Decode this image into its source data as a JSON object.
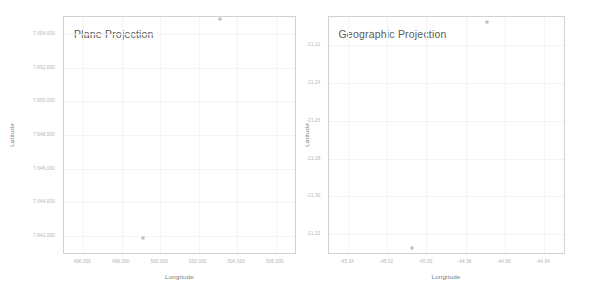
{
  "chart_data": [
    {
      "type": "scatter",
      "title": "Plane Projection",
      "xlabel": "Longitude",
      "ylabel": "Latitude",
      "grid": true,
      "legend": "none",
      "xlim": [
        495000,
        507000
      ],
      "ylim": [
        7641000,
        7655000
      ],
      "xticks": [
        "496.000",
        "498.000",
        "500.000",
        "502.000",
        "504.000",
        "506.000"
      ],
      "xtick_values": [
        496000,
        498000,
        500000,
        502000,
        504000,
        506000
      ],
      "yticks": [
        "7.654.000",
        "7.652.000",
        "7.650.000",
        "7.648.000",
        "7.646.000",
        "7.644.000",
        "7.642.000"
      ],
      "ytick_values": [
        7654000,
        7652000,
        7650000,
        7648000,
        7646000,
        7644000,
        7642000
      ],
      "points": [
        {
          "x": 503100,
          "y": 7654900
        },
        {
          "x": 499100,
          "y": 7641900
        }
      ],
      "marker_color": "#bdbdbd"
    },
    {
      "type": "scatter",
      "title": "Geographic Projection",
      "xlabel": "Longitude",
      "ylabel": "Latitude",
      "grid": true,
      "legend": "none",
      "xlim": [
        -45.05,
        -44.93
      ],
      "ylim": [
        -21.33,
        -21.205
      ],
      "xticks": [
        "-45.04",
        "-45.02",
        "-45.00",
        "-44.98",
        "-44.96",
        "-44.94"
      ],
      "xtick_values": [
        -45.04,
        -45.02,
        -45.0,
        -44.98,
        -44.96,
        -44.94
      ],
      "yticks": [
        "-21.22",
        "-21.24",
        "-21.26",
        "-21.28",
        "-21.30",
        "-21.32"
      ],
      "ytick_values": [
        -21.22,
        -21.24,
        -21.26,
        -21.28,
        -21.3,
        -21.32
      ],
      "points": [
        {
          "x": -44.969,
          "y": -21.2075
        },
        {
          "x": -45.0075,
          "y": -21.3275
        }
      ],
      "marker_color": "#bdbdbd"
    }
  ],
  "panels": [
    {
      "id": "plane-projection",
      "title": "Plane Projection",
      "xaxis_title": "Longitude",
      "yaxis_title": "Latitude",
      "xticks": [
        "496.000",
        "498.000",
        "500.000",
        "502.000",
        "504.000",
        "506.000"
      ],
      "yticks": [
        "7.654.000",
        "7.652.000",
        "7.650.000",
        "7.648.000",
        "7.646.000",
        "7.644.000",
        "7.642.000"
      ]
    },
    {
      "id": "geographic-projection",
      "title": "Geographic Projection",
      "xaxis_title": "Longitude",
      "yaxis_title": "Latitude",
      "xticks": [
        "-45.04",
        "-45.02",
        "-45.00",
        "-44.98",
        "-44.96",
        "-44.94"
      ],
      "yticks": [
        "-21.22",
        "-21.24",
        "-21.26",
        "-21.28",
        "-21.30",
        "-21.32"
      ]
    }
  ],
  "colors": {
    "frame": "#d2d2d2",
    "grid": "#f4f4f4",
    "tick_text": "#b4b4b4",
    "axis_title": "#7a7a7a",
    "plot_title": "#5a5a5a",
    "marker": "#bdbdbd",
    "background": "#ffffff"
  }
}
